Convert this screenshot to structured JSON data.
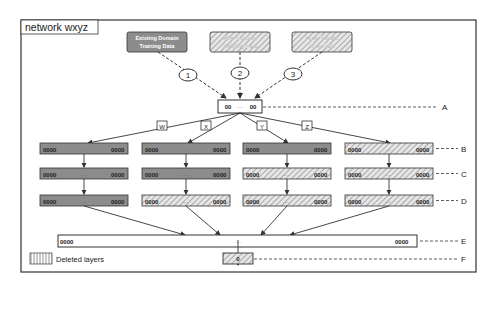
{
  "frame": {
    "title": "network wxyz"
  },
  "inputs": [
    {
      "id": "existing-train",
      "line1": "Existing Domain",
      "line2": "Training Data",
      "fill": "solid",
      "step": "1"
    },
    {
      "id": "new-train",
      "line1": "New Domain",
      "line2": "Training Data",
      "fill": "hatched",
      "step": "2"
    },
    {
      "id": "new-test",
      "line1": "New Domain",
      "line2": "Test Data",
      "fill": "hatched",
      "step": "3"
    }
  ],
  "branches": [
    {
      "label": "W",
      "layers": [
        "solid",
        "solid",
        "solid"
      ]
    },
    {
      "label": "X",
      "layers": [
        "solid",
        "solid",
        "hatched"
      ]
    },
    {
      "label": "Y",
      "layers": [
        "solid",
        "hatched",
        "hatched"
      ]
    },
    {
      "label": "Z",
      "layers": [
        "hatched",
        "hatched",
        "hatched"
      ]
    }
  ],
  "layer_labels": {
    "A": "A",
    "B": "B",
    "C": "C",
    "D": "D",
    "E": "E",
    "F": "F"
  },
  "node_text": {
    "dots": "0000",
    "ellipsis": "···",
    "a_left": "00",
    "a_right": "00",
    "f_node": "0"
  },
  "legend": {
    "label": "Deleted layers"
  },
  "colors": {
    "solid_fill": "#8c8c8c",
    "hatch_bg": "#e6e6e6",
    "hatch_line": "#9a9a9a",
    "stroke": "#333333"
  }
}
